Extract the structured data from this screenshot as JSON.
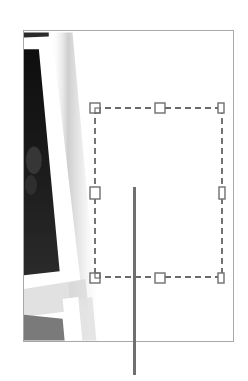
{
  "figure": {
    "colors": {
      "frame_border": "#a8a8a8",
      "photo_dark": "#141414",
      "photo_mid": "#6a6a6a",
      "selection_dash": "#3a3a3a",
      "handle_stroke": "#6e6e6e",
      "leader_line": "#6f6f6f"
    },
    "selection_box": {
      "left": 95,
      "top": 108,
      "right": 222,
      "bottom": 277,
      "handle_size": 10,
      "handles": [
        "top-left",
        "top-middle",
        "top-right",
        "middle-left",
        "middle-right",
        "bottom-left",
        "bottom-middle",
        "bottom-right"
      ]
    },
    "leader_line": {
      "x": 134,
      "y_start": 187,
      "y_end": 375
    }
  }
}
